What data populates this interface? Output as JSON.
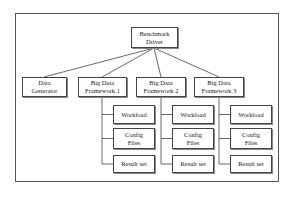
{
  "diagram": {
    "root": {
      "label": "Benchmark\nDriver"
    },
    "level2": [
      {
        "label": "Data\nGenerator"
      },
      {
        "label": "Big Data\nFramework 1"
      },
      {
        "label": "Big Data\nFramework 2"
      },
      {
        "label": "Big Data\nFramework 3"
      }
    ],
    "framework_children": [
      [
        {
          "label": "Workload"
        },
        {
          "label": "Config\nFiles"
        },
        {
          "label": "Result set"
        }
      ],
      [
        {
          "label": "Workload"
        },
        {
          "label": "Config\nFiles"
        },
        {
          "label": "Result set"
        }
      ],
      [
        {
          "label": "Workload"
        },
        {
          "label": "Config\nFiles"
        },
        {
          "label": "Result set"
        }
      ]
    ],
    "colors": {
      "stroke": "#444444",
      "frame": "#555555",
      "background": "#ffffff",
      "text": "#222222"
    }
  }
}
